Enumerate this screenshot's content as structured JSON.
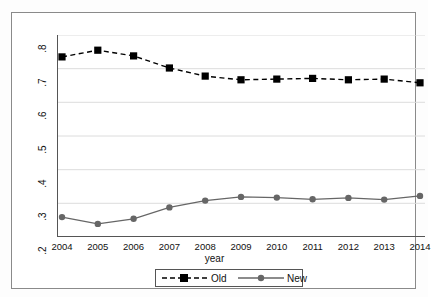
{
  "chart_data": {
    "type": "line",
    "title": "",
    "subtitle": "",
    "xlabel": "year",
    "ylabel": "",
    "categories": [
      2004,
      2005,
      2006,
      2007,
      2008,
      2009,
      2010,
      2011,
      2012,
      2013,
      2014
    ],
    "x": [
      2004,
      2005,
      2006,
      2007,
      2008,
      2009,
      2010,
      2011,
      2012,
      2013,
      2014
    ],
    "series": [
      {
        "name": "Old",
        "values": [
          0.735,
          0.755,
          0.738,
          0.702,
          0.678,
          0.667,
          0.669,
          0.671,
          0.667,
          0.669,
          0.658
        ],
        "color": "#000000",
        "line_style": "dashed",
        "marker": "square"
      },
      {
        "name": "New",
        "values": [
          0.259,
          0.239,
          0.254,
          0.288,
          0.308,
          0.319,
          0.317,
          0.312,
          0.316,
          0.311,
          0.322
        ],
        "color": "#666666",
        "line_style": "solid",
        "marker": "circle"
      }
    ],
    "ylim": [
      0.2,
      0.8
    ],
    "xlim": [
      2004,
      2014
    ],
    "yticks": [
      0.2,
      0.3,
      0.4,
      0.5,
      0.6,
      0.7,
      0.8
    ],
    "ytick_labels": [
      ".2",
      ".3",
      ".4",
      ".5",
      ".6",
      ".7",
      ".8"
    ],
    "xticks": [
      2004,
      2005,
      2006,
      2007,
      2008,
      2009,
      2010,
      2011,
      2012,
      2013,
      2014
    ],
    "xtick_labels": [
      "2004",
      "2005",
      "2006",
      "2007",
      "2008",
      "2009",
      "2010",
      "2011",
      "2012",
      "2013",
      "2014"
    ],
    "grid": "horizontal",
    "grid_color": "#dcdcdc",
    "legend_position": "bottom-center",
    "legend_entries": [
      "Old",
      "New"
    ],
    "background_color": "#ffffff",
    "frame_color": "#8a8a8a",
    "axis_color": "#555555"
  },
  "axes": {
    "x_title": "year",
    "y_title": ""
  },
  "legend": {
    "items": [
      {
        "label": "Old"
      },
      {
        "label": "New"
      }
    ]
  }
}
